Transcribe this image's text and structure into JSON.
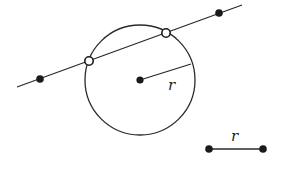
{
  "diagram": {
    "colors": {
      "stroke": "#2a2a2a",
      "background": "#ffffff"
    },
    "circle": {
      "cx": 140,
      "cy": 80,
      "r": 55,
      "center_label": ""
    },
    "radius_segment": {
      "x1": 140,
      "y1": 80,
      "x2": 191,
      "y2": 64,
      "label": "r",
      "label_x": 168,
      "label_y": 90
    },
    "secant_line": {
      "x1": 17,
      "y1": 87,
      "x2": 242,
      "y2": 5
    },
    "line_points": [
      {
        "type": "filled",
        "cx": 40,
        "cy": 79
      },
      {
        "type": "filled",
        "cx": 219,
        "cy": 13
      }
    ],
    "intersection_points": [
      {
        "type": "open",
        "cx": 89,
        "cy": 61
      },
      {
        "type": "open",
        "cx": 166,
        "cy": 33
      }
    ],
    "reference_segment": {
      "x1": 209,
      "y1": 149,
      "x2": 263,
      "y2": 149,
      "label": "r",
      "label_x": 231,
      "label_y": 141
    }
  }
}
